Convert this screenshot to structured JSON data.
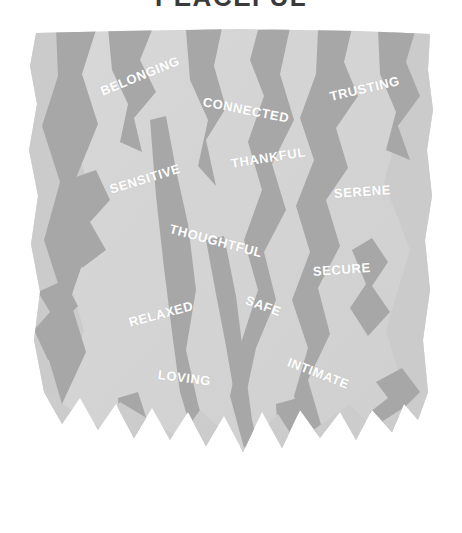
{
  "page": {
    "title": "PEACEFUL",
    "background_color": "#ffffff"
  },
  "illustration": {
    "name": "cracked-stone-shape",
    "base_color": "#d9d9d9",
    "crack_color": "#a8a8a8",
    "edge_shadow_color": "#c7c7c7",
    "word_color": "#ffffff"
  },
  "words": [
    {
      "label": "BELONGING",
      "x": 101,
      "y": 90,
      "rotate": -22,
      "size": 13
    },
    {
      "label": "CONNECTED",
      "x": 203,
      "y": 100,
      "rotate": 11,
      "size": 13
    },
    {
      "label": "TRUSTING",
      "x": 330,
      "y": 95,
      "rotate": -13,
      "size": 13
    },
    {
      "label": "THANKFUL",
      "x": 231,
      "y": 162,
      "rotate": -9,
      "size": 13
    },
    {
      "label": "SENSITIVE",
      "x": 110,
      "y": 188,
      "rotate": -17,
      "size": 13
    },
    {
      "label": "SERENE",
      "x": 334,
      "y": 192,
      "rotate": -4,
      "size": 13
    },
    {
      "label": "THOUGHTFUL",
      "x": 170,
      "y": 227,
      "rotate": 15,
      "size": 13
    },
    {
      "label": "SECURE",
      "x": 313,
      "y": 270,
      "rotate": -4,
      "size": 13
    },
    {
      "label": "RELAXED",
      "x": 129,
      "y": 321,
      "rotate": -15,
      "size": 13
    },
    {
      "label": "SAFE",
      "x": 246,
      "y": 298,
      "rotate": 20,
      "size": 13
    },
    {
      "label": "INTIMATE",
      "x": 288,
      "y": 360,
      "rotate": 21,
      "size": 13
    },
    {
      "label": "LOVING",
      "x": 158,
      "y": 373,
      "rotate": 7,
      "size": 13
    }
  ]
}
